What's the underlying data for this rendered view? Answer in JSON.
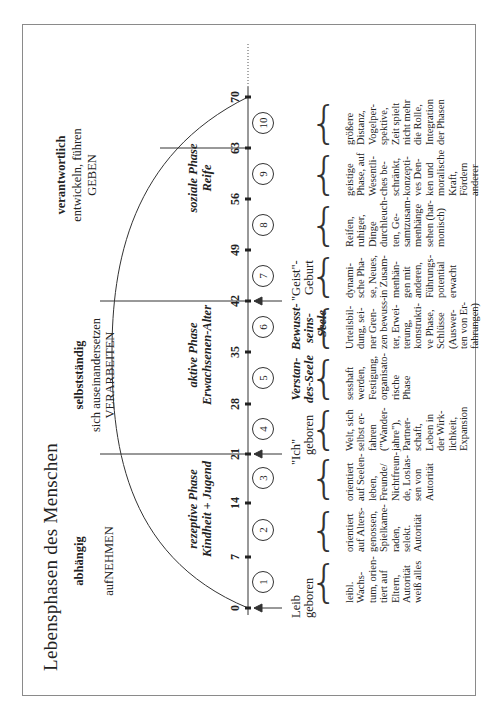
{
  "title": "Lebensphasen des Menschen",
  "stages": [
    {
      "attitude": "abhängig",
      "action": "aufNEHMEN",
      "phase_name": "rezeptive Phase",
      "phase_sub": "Kindheit + Jugend"
    },
    {
      "attitude": "selbstständig",
      "sub": "sich auseinandersetzen",
      "action": "VERARBEITEN",
      "phase_name": "aktive Phase",
      "phase_sub": "Erwachsenen-Alter"
    },
    {
      "attitude": "verantwortlich",
      "sub": "entwickeln, führen",
      "action": "GEBEN",
      "phase_name": "soziale Phase",
      "phase_sub": "Reife"
    }
  ],
  "axis": {
    "ticks": [
      "0",
      "7",
      "14",
      "21",
      "28",
      "35",
      "42",
      "49",
      "56",
      "63",
      "70"
    ]
  },
  "births": [
    {
      "line1": "Leib",
      "line2": "geboren"
    },
    {
      "line1": "\"Ich\"",
      "line2": "geboren"
    },
    {
      "line1": "\"Geist\"-",
      "line2": "Geburt"
    }
  ],
  "souls": [
    {
      "line1": "Verstan-",
      "line2": "des-Seele"
    },
    {
      "line1": "Bewusst-",
      "line2": "seins-",
      "line3": "Seele"
    }
  ],
  "periods": [
    {
      "num": "1",
      "text": "leibl.\nWachs-\ntum, orien-\ntiert auf\nEltern,\nAutorität\nweiß alles"
    },
    {
      "num": "2",
      "text": "orientiert\nauf Alters-\ngenossen,\nSpielkame-\nraden,\nselekt.\nAutorität"
    },
    {
      "num": "3",
      "text": "orientiert\nauf Seelen-\nleben,\nFreunde/\nNichtfreun-\nde, Loslas-\nsen von\nAutorität"
    },
    {
      "num": "4",
      "text": "Welt, sich\nselbst er-\nfahren\n(\"Wander-\njahre\"),\nPartner-\nschaft,\nLeben in\nder Wirk-\nlichkeit,\nExpansion"
    },
    {
      "num": "5",
      "text": "sesshaft\nwerden,\nFestigung,\norganisato-\nrische\nPhase"
    },
    {
      "num": "6",
      "text": "Urteilsbil-\ndung, sei-\nner Gren-\nzen bewuss-\nter, Erwei-\nterung,\nkonstrukti-\nve Phase,\nSchlüsse\n(Auswer-\nten von Er-\nfahrungen)"
    },
    {
      "num": "7",
      "text": "dynami-\nsche Pha-\nse, Neues,\nin Zusam-\nmenhän-\ngen mit\nanderen,\nFührungs-\npotential\nerwacht"
    },
    {
      "num": "8",
      "text": "Reifen,\nruhiger,\nDinge\ndurchleuch-\nten, Ge-\nsamtzusam-\nmenhänge\nsehen (har-\nmonisch)"
    },
    {
      "num": "9",
      "text": "geistige\nPhase, auf\nWesentli-\nches be-\nschränkt,\nkonzepti-\nves Den-\nken und\nmoralische\nKraft,\nFördern\nanderer"
    },
    {
      "num": "10",
      "text": "größere\nDistanz,\nVogelper-\nspektive,\nZeit spielt\nnicht mehr\ndie Rolle,\nIntegration\nder Phasen"
    }
  ]
}
